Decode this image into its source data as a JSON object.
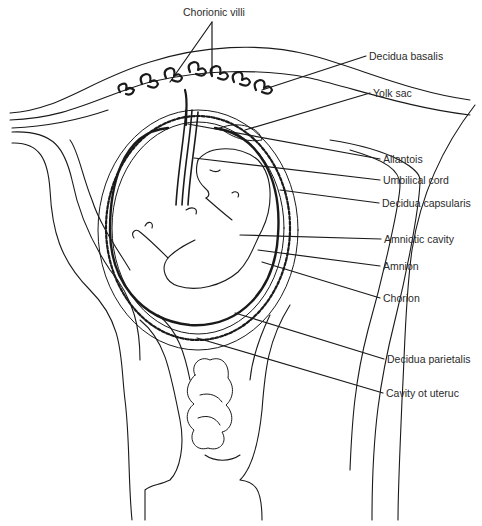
{
  "diagram": {
    "type": "anatomical-illustration",
    "line_color": "#1a1a1a",
    "background": "#ffffff",
    "labels": [
      {
        "id": "chorionic-villi",
        "text": "Chorionic villi",
        "x": 183,
        "y": 6
      },
      {
        "id": "decidua-basalis",
        "text": "Decidua basalis",
        "x": 369,
        "y": 53
      },
      {
        "id": "yolk-sac",
        "text": "Yolk sac",
        "x": 373,
        "y": 90
      },
      {
        "id": "allantois",
        "text": "Allantois",
        "x": 383,
        "y": 156
      },
      {
        "id": "umbilical-cord",
        "text": "Umbilical cord",
        "x": 383,
        "y": 176
      },
      {
        "id": "decidua-capsularis",
        "text": "Decidua capsularis",
        "x": 382,
        "y": 199
      },
      {
        "id": "amniotic-cavity",
        "text": "Amniotic cavity",
        "x": 384,
        "y": 236
      },
      {
        "id": "amnion",
        "text": "Amnion",
        "x": 383,
        "y": 263
      },
      {
        "id": "chorion",
        "text": "Chorion",
        "x": 383,
        "y": 295
      },
      {
        "id": "decidua-parietalis",
        "text": "Decidua parietalis",
        "x": 387,
        "y": 356
      },
      {
        "id": "cavity-of-uterus",
        "text": "Cavity ot uteruc",
        "x": 386,
        "y": 390
      }
    ]
  }
}
